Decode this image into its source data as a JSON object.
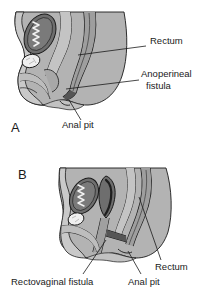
{
  "figure": {
    "type": "medical-illustration",
    "background_color": "#ffffff",
    "colors": {
      "body_fill": "#b3b3b3",
      "tissue_light": "#c9c9c9",
      "organ_dark": "#6e6e6e",
      "organ_mid": "#8d8d8d",
      "highlight_white": "#f2f2f2",
      "outline": "#1a1a1a",
      "text": "#1a1a1a"
    }
  },
  "panels": [
    {
      "letter": "A",
      "letter_x": 11,
      "letter_y": 121,
      "labels": [
        {
          "id": "rectum-a",
          "text": "Rectum",
          "x": 150,
          "y": 41,
          "leader": {
            "x1": 146,
            "y1": 46,
            "x2": 78,
            "y2": 55
          }
        },
        {
          "id": "anoperineal-fistula-a",
          "text": "Anoperineal",
          "text2": "fistula",
          "x": 141,
          "y": 74,
          "x2": 146,
          "y2": 86,
          "leader": {
            "x1": 139,
            "y1": 80,
            "x2": 65,
            "y2": 88
          }
        },
        {
          "id": "anal-pit-a",
          "text": "Anal pit",
          "x": 62,
          "y": 125,
          "leader": {
            "x1": 81,
            "y1": 120,
            "x2": 72,
            "y2": 98
          }
        }
      ]
    },
    {
      "letter": "B",
      "letter_x": 18,
      "letter_y": 168,
      "labels": [
        {
          "id": "rectovaginal-fistula-b",
          "text": "Rectovaginal fistula",
          "x": 11,
          "y": 280,
          "leader": {
            "x1": 83,
            "y1": 275,
            "x2": 105,
            "y2": 241
          }
        },
        {
          "id": "anal-pit-b",
          "text": "Anal pit",
          "x": 128,
          "y": 280,
          "leader": {
            "x1": 140,
            "y1": 275,
            "x2": 128,
            "y2": 250
          }
        },
        {
          "id": "rectum-b",
          "text": "Rectum",
          "x": 155,
          "y": 265,
          "leader": {
            "x1": 161,
            "y1": 262,
            "x2": 139,
            "y2": 196
          }
        }
      ]
    }
  ]
}
